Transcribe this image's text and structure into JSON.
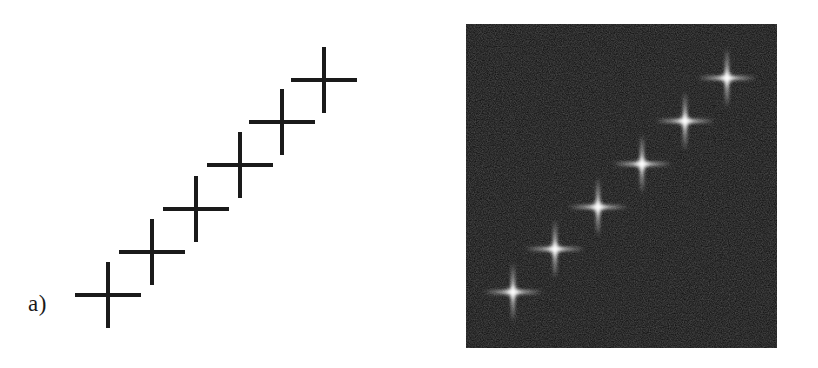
{
  "figure": {
    "background_color": "#ffffff",
    "width": 818,
    "height": 368,
    "panels": [
      {
        "id": "a",
        "caption": "a)",
        "type": "line-drawing",
        "description": "ideal binary staircase of six plus-shaped crosses",
        "stroke_color": "#1a1a1a",
        "stroke_width": 4
      },
      {
        "id": "b",
        "caption": "b)",
        "type": "noisy-raster",
        "description": "same six crosses rendered as blurred bright points on a dark noisy background",
        "background_color": "#0b0b0b",
        "point_color": "#ffffff",
        "noise_color": "#2a2a2a"
      }
    ]
  },
  "chart_data": {
    "type": "scatter",
    "title": "",
    "subtitle": "",
    "xlabel": "",
    "ylabel": "",
    "grid": false,
    "legend": null,
    "axis_visible": false,
    "tick_labels": [],
    "annotations": [
      "a)",
      "b)"
    ],
    "marker": "plus-cross",
    "n_points": 6,
    "xlim": [
      0,
      409
    ],
    "ylim": [
      368,
      0
    ],
    "series": [
      {
        "name": "panel-a-crosses",
        "panel": "a",
        "marker_color": "#1a1a1a",
        "arm_half_length": 33,
        "stroke_width": 4,
        "x": [
          108,
          152,
          196,
          240,
          282,
          324
        ],
        "y": [
          295,
          252,
          209,
          165,
          122,
          80
        ]
      },
      {
        "name": "panel-b-crosses",
        "panel": "b",
        "marker_color": "#ffffff",
        "arm_half_length": 30,
        "x": [
          513,
          555,
          598,
          642,
          685,
          727
        ],
        "y": [
          292,
          249,
          207,
          164,
          121,
          78
        ]
      }
    ],
    "panel_b_frame": {
      "x": 466,
      "y": 24,
      "width": 311,
      "height": 324
    }
  }
}
